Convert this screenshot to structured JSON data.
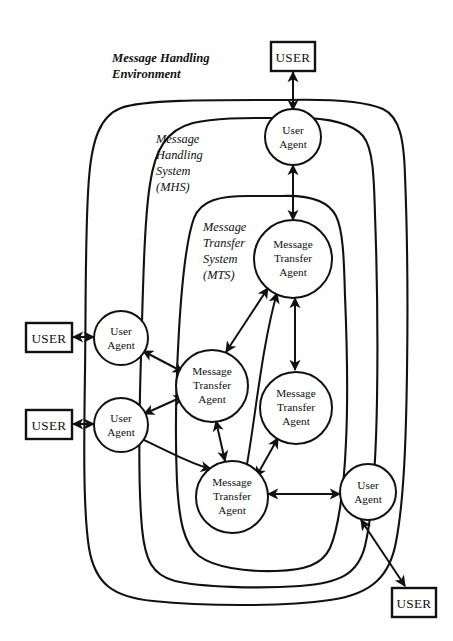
{
  "diagram": {
    "title": "Message Handling Environment",
    "zones": [
      {
        "id": "mhe",
        "lines": [
          "Message Handling",
          "Environment"
        ]
      },
      {
        "id": "mhs",
        "lines": [
          "Message",
          "Handling",
          "System",
          "(MHS)"
        ]
      },
      {
        "id": "mts",
        "lines": [
          "Message",
          "Transfer",
          "System",
          "(MTS)"
        ]
      }
    ],
    "node_labels": {
      "user": "USER",
      "user_agent_l1": "User",
      "user_agent_l2": "Agent",
      "mta_l1": "Message",
      "mta_l2": "Transfer",
      "mta_l3": "Agent"
    },
    "nodes": [
      {
        "id": "user-top",
        "type": "user",
        "lines": [
          "USER"
        ]
      },
      {
        "id": "user-left-1",
        "type": "user",
        "lines": [
          "USER"
        ]
      },
      {
        "id": "user-left-2",
        "type": "user",
        "lines": [
          "USER"
        ]
      },
      {
        "id": "user-bottom",
        "type": "user",
        "lines": [
          "USER"
        ]
      },
      {
        "id": "ua-top",
        "type": "user-agent",
        "lines": [
          "User",
          "Agent"
        ]
      },
      {
        "id": "ua-left-1",
        "type": "user-agent",
        "lines": [
          "User",
          "Agent"
        ]
      },
      {
        "id": "ua-left-2",
        "type": "user-agent",
        "lines": [
          "User",
          "Agent"
        ]
      },
      {
        "id": "ua-bottom",
        "type": "user-agent",
        "lines": [
          "User",
          "Agent"
        ]
      },
      {
        "id": "mta-top",
        "type": "mta",
        "lines": [
          "Message",
          "Transfer",
          "Agent"
        ]
      },
      {
        "id": "mta-left",
        "type": "mta",
        "lines": [
          "Message",
          "Transfer",
          "Agent"
        ]
      },
      {
        "id": "mta-right",
        "type": "mta",
        "lines": [
          "Message",
          "Transfer",
          "Agent"
        ]
      },
      {
        "id": "mta-bottom",
        "type": "mta",
        "lines": [
          "Message",
          "Transfer",
          "Agent"
        ]
      }
    ],
    "colors": {
      "ink": "#111111",
      "paper": "#fefefe"
    }
  }
}
